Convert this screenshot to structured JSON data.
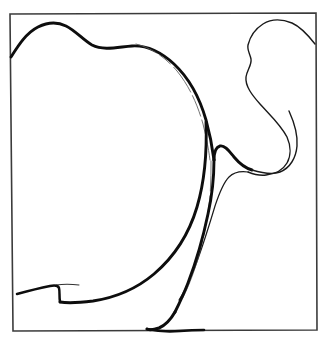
{
  "figure": {
    "background_color": "#ffffff",
    "ink_color": "#0d0d0d",
    "frame_color": "#3b3b3b",
    "width": 334,
    "height": 343
  },
  "frame": {
    "name": "sketch-border-rectangle",
    "path": "M 10 14 L 316 13 L 317 330 L 13 331 Z",
    "stroke_width": 1.6
  },
  "strokes": [
    {
      "name": "upper-left-lobe-outline",
      "description": "Thick curve from left border rising over a rounded hump then sweeping right and down the big lobe to the lower centre",
      "color": "#0d0d0d",
      "width": 2.9,
      "opacity": 1,
      "path": "M 11 57 C 18 46 26 33 38 27 C 48 22 58 22 66 26 C 76 31 83 40 92 45 C 104 51 118 47 132 46 C 148 45 162 53 174 64 C 190 79 200 99 206 120 C 211 138 213 152 214 160"
    },
    {
      "name": "upper-left-lobe-inner-highlight",
      "description": "Thin faint inner line running parallel just inside the thick lobe outline",
      "color": "#5a5a5a",
      "width": 1.0,
      "opacity": 0.85,
      "dash": "22 4 14 5 30 4",
      "path": "M 136 44 C 152 48 166 58 177 71 C 190 87 198 106 203 124 C 207 140 209 152 210 160"
    },
    {
      "name": "lobe-neck-cusp",
      "description": "Thick stroke forming the sharp inward cusp at mid-right where the lobe narrows into the neck",
      "color": "#0d0d0d",
      "width": 2.9,
      "opacity": 1,
      "path": "M 214 160 C 214 152 216 147 220 146 C 225 145 229 151 234 157 C 239 163 245 168 252 170"
    },
    {
      "name": "right-bulb-lower-hook",
      "description": "Thin curve sweeping right from the cusp, bulging out and hooking back left under the right bulb",
      "color": "#1a1a1a",
      "width": 1.4,
      "opacity": 1,
      "path": "M 252 170 C 262 173 272 175 280 172 C 290 168 296 158 297 146 C 298 134 294 122 289 111"
    },
    {
      "name": "right-bulb-outline",
      "description": "Thin closed-looking blob in the upper right corner, from right border over a hump, down with a small S kink to the neck",
      "color": "#1a1a1a",
      "width": 1.4,
      "opacity": 1,
      "path": "M 315 44 C 308 35 301 27 292 23 C 282 19 271 19 263 24 C 255 29 250 37 248 45 C 247 50 250 54 251 59 C 252 65 247 70 246 77 C 245 86 252 95 260 104 C 270 115 281 125 287 137 C 291 146 291 156 287 163 C 283 170 275 174 266 175 C 259 176 253 174 248 172"
    },
    {
      "name": "neck-inner-thin-line",
      "description": "Thin line descending from the hook back down through the neck toward the lower centre",
      "color": "#1a1a1a",
      "width": 1.2,
      "opacity": 1,
      "path": "M 248 172 C 241 171 234 172 229 177 C 223 183 219 194 215 206 C 209 226 201 252 193 272 C 188 284 183 294 179 300"
    },
    {
      "name": "neck-inner-faint-line",
      "description": "Faint broken inner line inside the neck, parallel to the main descending stroke",
      "color": "#5a5a5a",
      "width": 1.0,
      "opacity": 0.8,
      "dash": "30 5 40 6 60 5",
      "path": "M 211 161 C 211 175 211 190 209 205 C 206 228 201 250 195 268 C 190 283 185 294 181 301"
    },
    {
      "name": "neck-descending-thick-stroke",
      "description": "Thick stroke running down from the cusp through the neck to the bottom tuck",
      "color": "#0d0d0d",
      "width": 2.9,
      "opacity": 1,
      "path": "M 214 160 C 214 178 212 196 208 214 C 203 238 196 262 188 283 C 183 296 178 306 175 312"
    },
    {
      "name": "lower-left-sweep",
      "description": "Thick stroke sweeping from the lobe down-left across the lower area to the bottom tuck",
      "color": "#0d0d0d",
      "width": 2.9,
      "opacity": 1,
      "path": "M 206 122 C 207 150 205 180 197 207 C 189 234 174 257 154 274 C 135 290 113 298 93 301 C 77 303 66 303 60 302"
    },
    {
      "name": "bottom-left-cusp-line",
      "description": "Thick line from the left border with a sharp cusp hook then running right along the lower area",
      "color": "#0d0d0d",
      "width": 2.5,
      "opacity": 1,
      "path": "M 17 294 C 28 291 40 288 50 286 C 55 285 58 285 59 288 C 60 292 59 296 60 302"
    },
    {
      "name": "bottom-left-cusp-upper-whisker",
      "description": "Thin tapering whisker leaving the cusp to the right",
      "color": "#1a1a1a",
      "width": 1.1,
      "opacity": 0.9,
      "path": "M 56 285 C 63 284 71 284 79 285"
    },
    {
      "name": "bottom-tuck-stroke",
      "description": "Thick stroke that curls down and flattens onto the bottom border",
      "color": "#0d0d0d",
      "width": 3.0,
      "opacity": 1,
      "path": "M 175 312 C 171 319 166 325 159 328 C 153 330 149 330 147 329"
    },
    {
      "name": "bottom-border-overlap",
      "description": "Thickened segment where the drawing merges with the bottom border",
      "color": "#0d0d0d",
      "width": 2.6,
      "opacity": 1,
      "path": "M 147 329 C 156 331 168 332 180 331 C 192 330 199 330 204 330"
    }
  ],
  "meta": {
    "stroke_count_label": "14",
    "type": "line-drawing"
  }
}
